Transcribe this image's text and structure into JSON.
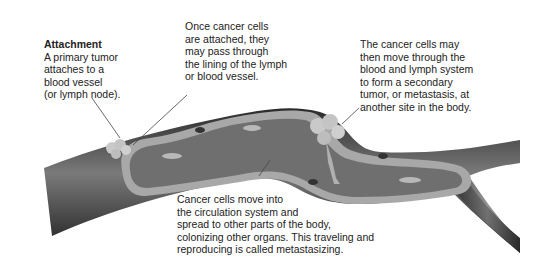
{
  "diagram": {
    "type": "illustration",
    "labels": {
      "attachment": {
        "title": "Attachment",
        "lines": [
          "A primary tumor",
          "attaches to a",
          "blood vessel",
          "(or lymph node)."
        ]
      },
      "pass_through": {
        "lines": [
          "Once cancer cells",
          "are attached, they",
          "may pass through",
          "the lining of the lymph",
          "or blood vessel."
        ]
      },
      "secondary_tumor": {
        "lines": [
          "The cancer cells may",
          "then move through the",
          "blood and lymph system",
          "to form a secondary",
          "tumor, or metastasis, at",
          "another site in the body."
        ]
      },
      "circulation": {
        "lines": [
          "Cancer cells move into",
          "the circulation system and",
          "spread to other parts of the body,",
          "colonizing other organs. This traveling and",
          "reproducing is called metastasizing."
        ]
      }
    },
    "elements": [
      "blood-vessel",
      "vessel-lining",
      "primary-tumor",
      "secondary-tumor",
      "cancer-cells",
      "blood-cells",
      "vessel-branch"
    ],
    "colors": {
      "vessel_dark": "#2e2e2e",
      "vessel_mid": "#555555",
      "lumen": "#6f6f6f",
      "lining": "#a8a8a8",
      "tumor": "#c9c9c9",
      "text": "#222222"
    }
  }
}
